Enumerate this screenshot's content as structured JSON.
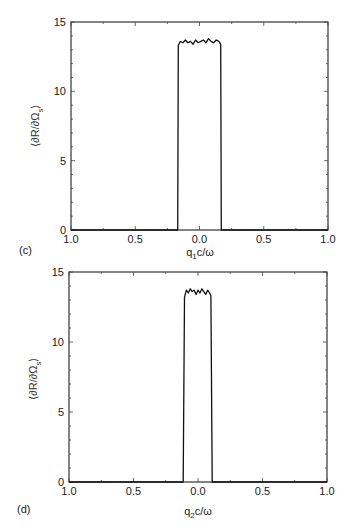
{
  "chart_data": [
    {
      "type": "line",
      "panel": "(c)",
      "title": "",
      "xlabel": "q1c/ω",
      "xlabel_main": "q",
      "xlabel_sub": "1",
      "xlabel_rest": "c/ω",
      "ylabel": "⟨∂R/∂Ωs⟩",
      "ylabel_main": "⟨∂R/∂Ω",
      "ylabel_sub": "s",
      "ylabel_close": "⟩",
      "xlim": [
        -1.0,
        1.0
      ],
      "ylim": [
        0,
        15
      ],
      "xticks": [
        -1.0,
        -0.5,
        0.0,
        0.5,
        1.0
      ],
      "xtick_labels": [
        "1.0",
        "0.5",
        "0.0",
        "0.5",
        "1.0"
      ],
      "yticks": [
        0,
        5,
        10,
        15
      ],
      "ytick_labels": [
        "0",
        "5",
        "10",
        "15"
      ],
      "grid": false,
      "legend": null,
      "x": [
        -1.0,
        -0.17,
        -0.165,
        -0.15,
        -0.13,
        -0.11,
        -0.09,
        -0.07,
        -0.05,
        -0.03,
        -0.01,
        0.01,
        0.03,
        0.05,
        0.07,
        0.09,
        0.11,
        0.13,
        0.15,
        0.165,
        0.17,
        1.0
      ],
      "y": [
        0,
        0,
        13.3,
        13.6,
        13.5,
        13.7,
        13.5,
        13.6,
        13.4,
        13.7,
        13.5,
        13.6,
        13.7,
        13.5,
        13.8,
        13.6,
        13.5,
        13.7,
        13.6,
        13.4,
        0,
        0
      ]
    },
    {
      "type": "line",
      "panel": "(d)",
      "title": "",
      "xlabel": "q2c/ω",
      "xlabel_main": "q",
      "xlabel_sub": "2",
      "xlabel_rest": "c/ω",
      "ylabel": "⟨∂R/∂Ωs⟩",
      "ylabel_main": "⟨∂R/∂Ω",
      "ylabel_sub": "s",
      "ylabel_close": "⟩",
      "xlim": [
        -1.0,
        1.0
      ],
      "ylim": [
        0,
        15
      ],
      "xticks": [
        -1.0,
        -0.5,
        0.0,
        0.5,
        1.0
      ],
      "xtick_labels": [
        "1.0",
        "0.5",
        "0.0",
        "0.5",
        "1.0"
      ],
      "yticks": [
        0,
        5,
        10,
        15
      ],
      "ytick_labels": [
        "0",
        "5",
        "10",
        "15"
      ],
      "grid": false,
      "legend": null,
      "x": [
        -1.0,
        -0.115,
        -0.105,
        -0.09,
        -0.075,
        -0.06,
        -0.045,
        -0.03,
        -0.015,
        0.0,
        0.015,
        0.03,
        0.045,
        0.06,
        0.075,
        0.09,
        0.1,
        0.11,
        1.0
      ],
      "y": [
        0,
        0,
        13.2,
        13.7,
        13.5,
        13.8,
        13.6,
        13.7,
        13.4,
        13.7,
        13.5,
        13.8,
        13.6,
        13.4,
        13.7,
        13.5,
        13.3,
        0,
        0
      ]
    }
  ],
  "panels": [
    {
      "label": "(c)"
    },
    {
      "label": "(d)"
    }
  ]
}
